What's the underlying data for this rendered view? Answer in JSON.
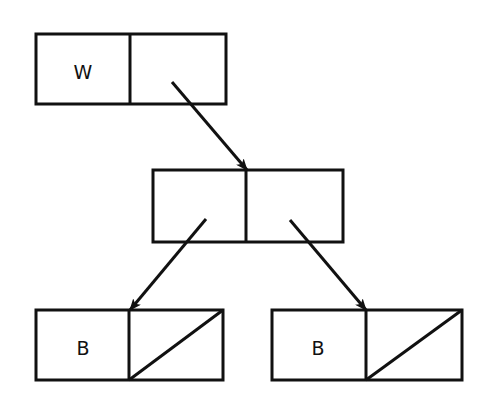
{
  "diagram": {
    "title": "",
    "colors": {
      "stroke": "#111111",
      "background": "#ffffff"
    },
    "nodes": [
      {
        "id": "top-cell",
        "x": 36,
        "y": 34,
        "width": 190,
        "height": 70,
        "divider_x": 130,
        "left_label": "W",
        "right_label": "",
        "right_nil": false
      },
      {
        "id": "middle-cell",
        "x": 153,
        "y": 170,
        "width": 190,
        "height": 72,
        "divider_x": 246,
        "left_label": "",
        "right_label": "",
        "right_nil": false
      },
      {
        "id": "bottom-left-cell",
        "x": 36,
        "y": 310,
        "width": 187,
        "height": 70,
        "divider_x": 129,
        "left_label": "B",
        "right_label": "",
        "right_nil": true
      },
      {
        "id": "bottom-right-cell",
        "x": 272,
        "y": 310,
        "width": 190,
        "height": 70,
        "divider_x": 366,
        "left_label": "B",
        "right_label": "",
        "right_nil": true
      }
    ],
    "edges": [
      {
        "id": "top-to-middle",
        "from": "top-cell.right",
        "to": "middle-cell",
        "x1": 172,
        "y1": 82,
        "x2": 247,
        "y2": 170
      },
      {
        "id": "middle-to-bottom-left",
        "from": "middle-cell.left",
        "to": "bottom-left-cell",
        "x1": 206,
        "y1": 219,
        "x2": 130,
        "y2": 310
      },
      {
        "id": "middle-to-bottom-right",
        "from": "middle-cell.right",
        "to": "bottom-right-cell",
        "x1": 290,
        "y1": 220,
        "x2": 366,
        "y2": 310
      }
    ],
    "labels": {
      "top_left": "W",
      "bottom_left_left": "B",
      "bottom_right_left": "B"
    }
  }
}
